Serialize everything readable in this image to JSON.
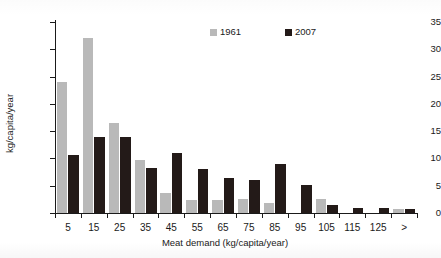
{
  "chart_data": {
    "type": "bar",
    "title": "",
    "xlabel": "Meat demand (kg/capita/year)",
    "ylabel": "kg/capita/year",
    "categories": [
      "5",
      "15",
      "25",
      "35",
      "45",
      "55",
      "65",
      "75",
      "85",
      "95",
      "105",
      "115",
      "125",
      ">"
    ],
    "series": [
      {
        "name": "1961",
        "color": "#b9b9b9",
        "values": [
          24,
          32,
          16.5,
          9.8,
          3.7,
          2.4,
          2.4,
          2.5,
          1.8,
          0,
          2.6,
          0,
          0,
          0.8
        ]
      },
      {
        "name": "2007",
        "color": "#231a18",
        "values": [
          10.7,
          14,
          14,
          8.2,
          11,
          8.1,
          6.4,
          6,
          9,
          5.2,
          1.4,
          1,
          1,
          0.8
        ]
      }
    ],
    "ylim": [
      0,
      35
    ],
    "yticks": [
      0,
      5,
      10,
      15,
      20,
      25,
      30,
      35
    ],
    "ytick_labels": [
      "0",
      "5",
      "10",
      "15",
      "20",
      "25",
      "30",
      "35"
    ],
    "grid": false,
    "legend_position": "top-center"
  }
}
